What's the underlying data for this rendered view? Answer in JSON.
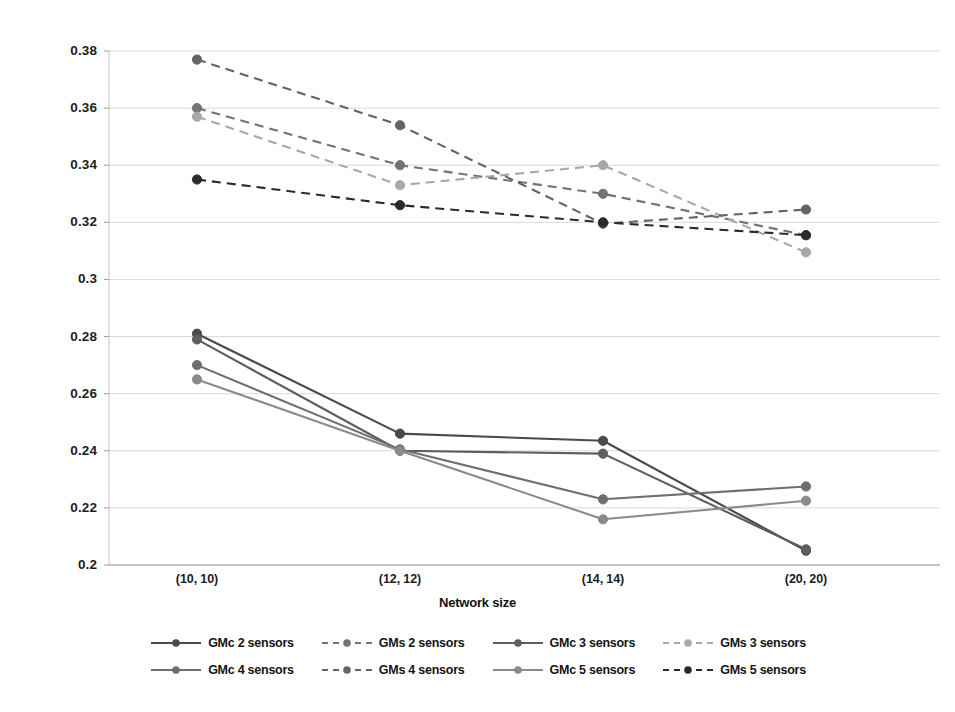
{
  "chart_data": {
    "type": "line",
    "title": "",
    "subtitle": "",
    "xlabel": "Network size",
    "ylabel": "",
    "categories": [
      "(10, 10)",
      "(12, 12)",
      "(14, 14)",
      "(20, 20)"
    ],
    "ylim": [
      0.2,
      0.38
    ],
    "yticks": [
      0.2,
      0.22,
      0.24,
      0.26,
      0.28,
      0.3,
      0.32,
      0.34,
      0.36,
      0.38
    ],
    "ytick_labels": [
      "0.2",
      "0.22",
      "0.24",
      "0.26",
      "0.28",
      "0.3",
      "0.32",
      "0.34",
      "0.36",
      "0.38"
    ],
    "grid": "horizontal",
    "legend_position": "bottom",
    "legend_columns": 4,
    "series": [
      {
        "name": "GMc 2 sensors",
        "style": "solid",
        "color": "#4a4a4a",
        "marker": "circle",
        "values": [
          0.281,
          0.246,
          0.2435,
          0.205
        ]
      },
      {
        "name": "GMs 2 sensors",
        "style": "dashed",
        "color": "#737373",
        "marker": "circle",
        "values": [
          0.36,
          0.34,
          0.33,
          0.3155
        ]
      },
      {
        "name": "GMc 3 sensors",
        "style": "solid",
        "color": "#5e5e5e",
        "marker": "circle",
        "values": [
          0.279,
          0.24,
          0.239,
          0.2055
        ]
      },
      {
        "name": "GMs 3 sensors",
        "style": "dashed",
        "color": "#a8a8a8",
        "marker": "circle",
        "values": [
          0.357,
          0.333,
          0.34,
          0.3095
        ]
      },
      {
        "name": "GMc 4 sensors",
        "style": "solid",
        "color": "#6e6e6e",
        "marker": "circle",
        "values": [
          0.27,
          0.2405,
          0.223,
          0.2275
        ]
      },
      {
        "name": "GMs 4 sensors",
        "style": "dashed",
        "color": "#636363",
        "marker": "circle",
        "values": [
          0.377,
          0.354,
          0.3195,
          0.3245
        ]
      },
      {
        "name": "GMc 5 sensors",
        "style": "solid",
        "color": "#8a8a8a",
        "marker": "circle",
        "values": [
          0.265,
          0.24,
          0.216,
          0.2225
        ]
      },
      {
        "name": "GMs 5 sensors",
        "style": "dashed",
        "color": "#2b2b2b",
        "marker": "circle",
        "values": [
          0.335,
          0.326,
          0.32,
          0.3155
        ]
      }
    ]
  },
  "axis": {
    "x_title": "Network size"
  },
  "legend": {
    "rows": [
      [
        "GMc 2 sensors",
        "GMs 2 sensors",
        "GMc 3 sensors",
        "GMs 3 sensors"
      ],
      [
        "GMc 4 sensors",
        "GMs 4 sensors",
        "GMc 5 sensors",
        "GMs 5 sensors"
      ]
    ]
  },
  "colors": {
    "grid": "#d9d9d9",
    "axis": "#c2c2c2",
    "text": "#1a1a1a",
    "background": "#ffffff"
  }
}
